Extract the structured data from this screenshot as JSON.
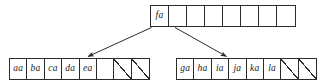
{
  "diagram": {
    "type": "tree-node-array-diagram",
    "colors": {
      "stroke": "#2b2b2b",
      "background": "#ffffff",
      "text": "#1a1a1a"
    },
    "nodes": [
      {
        "id": "root-node",
        "name": "root-node",
        "cell_count": 8,
        "cells": [
          {
            "label": "fa",
            "kind": "key"
          },
          {
            "label": "",
            "kind": "empty"
          },
          {
            "label": "",
            "kind": "empty"
          },
          {
            "label": "",
            "kind": "empty"
          },
          {
            "label": "",
            "kind": "empty"
          },
          {
            "label": "",
            "kind": "empty"
          },
          {
            "label": "",
            "kind": "empty"
          },
          {
            "label": "",
            "kind": "empty"
          }
        ]
      },
      {
        "id": "left-child-node",
        "name": "left-child-node",
        "cell_count": 8,
        "cells": [
          {
            "label": "aa",
            "kind": "key"
          },
          {
            "label": "ba",
            "kind": "key"
          },
          {
            "label": "ca",
            "kind": "key"
          },
          {
            "label": "da",
            "kind": "key"
          },
          {
            "label": "ea",
            "kind": "key"
          },
          {
            "label": "",
            "kind": "empty"
          },
          {
            "label": "",
            "kind": "null"
          },
          {
            "label": "",
            "kind": "null"
          }
        ]
      },
      {
        "id": "right-child-node",
        "name": "right-child-node",
        "cell_count": 8,
        "cells": [
          {
            "label": "ga",
            "kind": "key"
          },
          {
            "label": "ha",
            "kind": "key"
          },
          {
            "label": "ia",
            "kind": "key"
          },
          {
            "label": "ja",
            "kind": "key"
          },
          {
            "label": "ka",
            "kind": "key"
          },
          {
            "label": "la",
            "kind": "key"
          },
          {
            "label": "",
            "kind": "null"
          },
          {
            "label": "",
            "kind": "null"
          }
        ]
      }
    ],
    "edges": [
      {
        "id": "edge-root-to-left",
        "name": "edge-root-to-left",
        "from": "root-node",
        "to": "left-child-node",
        "arrow": true
      },
      {
        "id": "edge-root-to-right",
        "name": "edge-root-to-right",
        "from": "root-node",
        "to": "right-child-node",
        "arrow": true
      }
    ]
  }
}
